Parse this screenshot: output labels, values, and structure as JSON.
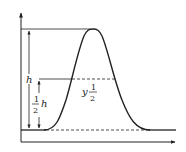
{
  "diagram": {
    "type": "peak-height-diagram",
    "labels": {
      "h": "h",
      "half_num": "1",
      "half_den": "2",
      "half_h_var": "h",
      "y_half_var": "y",
      "y_half_num": "1",
      "y_half_den": "2"
    },
    "colors": {
      "stroke": "#222222",
      "background": "#ffffff"
    }
  }
}
